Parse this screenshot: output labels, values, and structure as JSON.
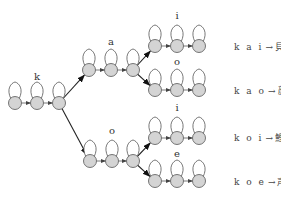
{
  "diagram": {
    "node_fill": "#d4d4d4",
    "stroke": "#555555",
    "groups": [
      {
        "id": "k",
        "label": "k",
        "x": [
          15,
          37,
          59
        ],
        "y": 103,
        "label_pos": [
          37,
          80
        ]
      },
      {
        "id": "ka",
        "label": "a",
        "x": [
          89,
          111,
          133
        ],
        "y": 70,
        "label_pos": [
          111,
          45
        ]
      },
      {
        "id": "ko",
        "label": "o",
        "x": [
          90,
          112,
          133
        ],
        "y": 161,
        "label_pos": [
          112,
          134
        ]
      },
      {
        "id": "kai",
        "label": "i",
        "x": [
          155,
          177,
          199
        ],
        "y": 46,
        "label_pos": [
          177,
          19
        ]
      },
      {
        "id": "kao",
        "label": "o",
        "x": [
          155,
          177,
          199
        ],
        "y": 90,
        "label_pos": [
          177,
          65
        ]
      },
      {
        "id": "koi",
        "label": "i",
        "x": [
          155,
          177,
          199
        ],
        "y": 138,
        "label_pos": [
          177,
          111
        ]
      },
      {
        "id": "koe",
        "label": "e",
        "x": [
          155,
          177,
          199
        ],
        "y": 181,
        "label_pos": [
          177,
          157
        ]
      }
    ],
    "branches": [
      {
        "from": "k",
        "to": "ka"
      },
      {
        "from": "k",
        "to": "ko"
      },
      {
        "from": "ka",
        "to": "kai"
      },
      {
        "from": "ka",
        "to": "kao"
      },
      {
        "from": "ko",
        "to": "koi"
      },
      {
        "from": "ko",
        "to": "koe"
      }
    ],
    "outputs": [
      {
        "phonemes": "k a i",
        "arrow": "→",
        "word": "貝",
        "y": 50
      },
      {
        "phonemes": "k a o",
        "arrow": "→",
        "word": "顔",
        "y": 94
      },
      {
        "phonemes": "k o i",
        "arrow": "→",
        "word": "鯉",
        "y": 141
      },
      {
        "phonemes": "k o e",
        "arrow": "→",
        "word": "声",
        "y": 185
      }
    ]
  }
}
